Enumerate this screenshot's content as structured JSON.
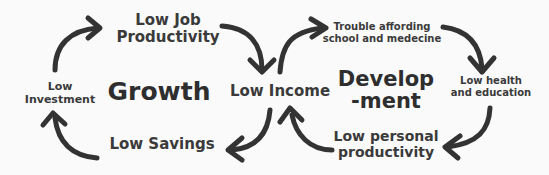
{
  "diagram": {
    "growth_cycle": {
      "center_label": "Growth",
      "nodes": {
        "low_job_productivity": "Low Job\nProductivity",
        "low_income": "Low Income",
        "low_savings": "Low Savings",
        "low_investment": "Low\nInvestment"
      }
    },
    "development_cycle": {
      "center_label": "Develop\n-ment",
      "nodes": {
        "trouble_affording": "Trouble affording\nschool and medecine",
        "low_health_education": "Low health\nand education",
        "low_personal_productivity": "Low personal\nproductivity"
      }
    },
    "colors": {
      "text": "#333333",
      "arrow": "#333333",
      "background": "#fafafa"
    }
  }
}
